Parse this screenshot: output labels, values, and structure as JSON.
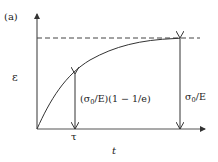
{
  "figure": {
    "panel_label": "(a)",
    "y_axis_label": "ε",
    "x_axis_label": "t",
    "tau_label": "τ",
    "annotation_mid": {
      "sigma": "σ",
      "sub": "0",
      "rest": "/E)(1 − 1/e)",
      "prefix": "("
    },
    "annotation_right": {
      "sigma": "σ",
      "sub": "0",
      "rest": "/E"
    },
    "curve": "ε(t) = (σ0/E)(1 − e^(−t/τ))",
    "asymptote_style": "dashed",
    "colors": {
      "line": "#333333",
      "background": "#ffffff"
    }
  }
}
